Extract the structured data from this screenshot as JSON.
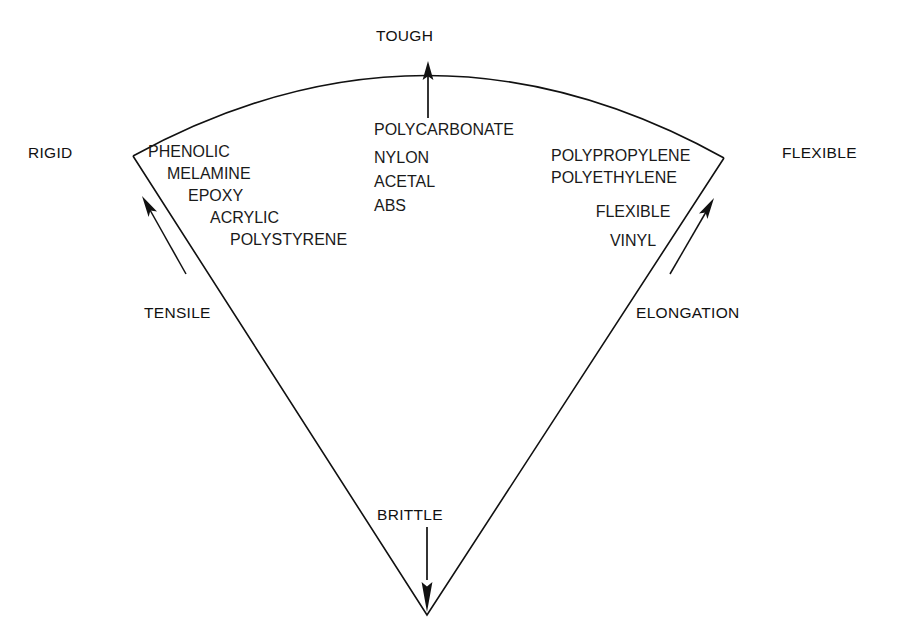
{
  "diagram": {
    "stroke_color": "#111111",
    "background_color": "#ffffff",
    "axes": {
      "left_label": "RIGID",
      "right_label": "FLEXIBLE",
      "top_label": "TOUGH",
      "bottom_label": "BRITTLE",
      "left_arrow_label": "TENSILE",
      "right_arrow_label": "ELONGATION"
    },
    "clusters": {
      "left": {
        "name": "rigid-materials",
        "items": [
          "PHENOLIC",
          "MELAMINE",
          "EPOXY",
          "ACRYLIC",
          "POLYSTYRENE"
        ]
      },
      "center": {
        "name": "tough-materials",
        "items": [
          "POLYCARBONATE",
          "NYLON",
          "ACETAL",
          "ABS"
        ]
      },
      "right": {
        "name": "flexible-materials",
        "items": [
          "POLYPROPYLENE",
          "POLYETHYLENE",
          "FLEXIBLE",
          "VINYL"
        ]
      }
    }
  }
}
